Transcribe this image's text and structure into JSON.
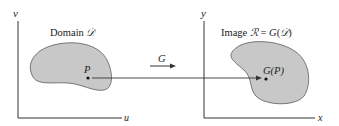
{
  "diagram": {
    "left_panel": {
      "axis_vertical_label": "v",
      "axis_horizontal_label": "u",
      "region_label_prefix": "Domain ",
      "region_label_symbol": "𝒟",
      "point_label": "P"
    },
    "mapping": {
      "label": "G"
    },
    "right_panel": {
      "axis_vertical_label": "y",
      "axis_horizontal_label": "x",
      "region_label_prefix": "Image ",
      "region_label_symbol": "ℛ",
      "region_label_equals": " = ",
      "region_label_func": "G",
      "region_label_open": "(",
      "region_label_arg": "𝒟",
      "region_label_close": ")",
      "point_label": "G(P)"
    },
    "colors": {
      "region_fill": "#c8c8c8",
      "region_stroke": "#5a5a5a",
      "axis": "#333333",
      "text": "#222222"
    }
  }
}
